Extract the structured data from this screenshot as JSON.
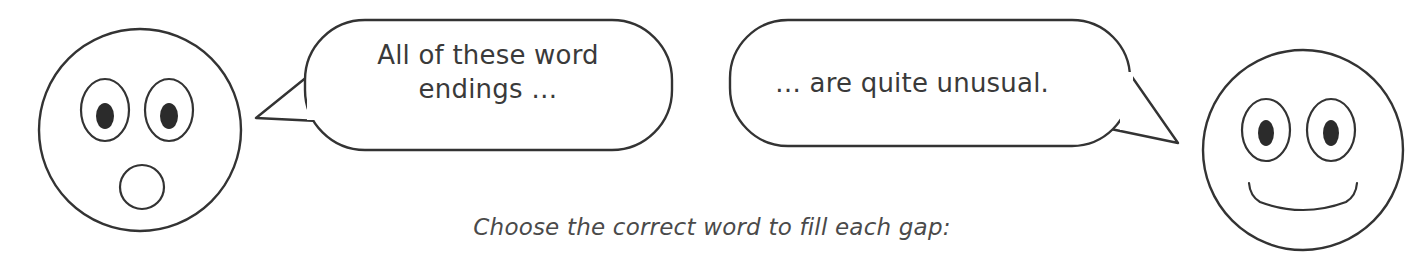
{
  "page": {
    "background_color": "#ffffff",
    "ink_color": "#333333",
    "text_color": "#3a3a3a"
  },
  "characters": {
    "left": {
      "name": "surprised-face",
      "expression": "surprised",
      "mouth": "open-round",
      "eyes": "wide-oval"
    },
    "right": {
      "name": "smiling-face",
      "expression": "smiling",
      "mouth": "smile-curve",
      "eyes": "oval"
    }
  },
  "speech": [
    {
      "speaker": "surprised-face",
      "text": "All of these word\nendings  …",
      "tail_direction": "left"
    },
    {
      "speaker": "smiling-face",
      "text": "… are quite unusual.",
      "tail_direction": "right"
    }
  ],
  "instruction": {
    "text": "Choose the correct word to fill each gap:"
  }
}
